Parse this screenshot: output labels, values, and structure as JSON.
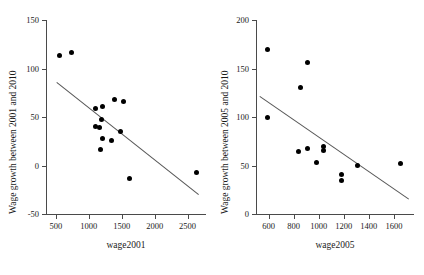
{
  "figure": {
    "panels": [
      {
        "id": "left",
        "xlabel": "wage2001",
        "ylabel": "Wage growth between 2001 and 2010",
        "xticks": [
          500,
          1000,
          1500,
          2000,
          2500
        ],
        "yticks": [
          -50,
          0,
          50,
          100,
          150
        ],
        "xlim": [
          350,
          2780
        ],
        "ylim": [
          -50,
          150
        ]
      },
      {
        "id": "right",
        "xlabel": "wage2005",
        "ylabel": "Wage growth between 2005 and 2010",
        "xticks": [
          600,
          800,
          1000,
          1200,
          1400,
          1600
        ],
        "yticks": [
          0,
          50,
          100,
          150,
          200
        ],
        "xlim": [
          500,
          1760
        ],
        "ylim": [
          0,
          200
        ]
      }
    ]
  },
  "chart_data": [
    {
      "type": "scatter",
      "title": "",
      "xlabel": "wage2001",
      "ylabel": "Wage growth between 2001 and 2010",
      "xlim": [
        350,
        2780
      ],
      "ylim": [
        -50,
        150
      ],
      "xticks": [
        500,
        1000,
        1500,
        2000,
        2500
      ],
      "yticks": [
        -50,
        0,
        50,
        100,
        150
      ],
      "grid": false,
      "legend": null,
      "points": [
        {
          "x": 550,
          "y": 113
        },
        {
          "x": 730,
          "y": 117
        },
        {
          "x": 1105,
          "y": 59
        },
        {
          "x": 1205,
          "y": 61
        },
        {
          "x": 1395,
          "y": 68
        },
        {
          "x": 1520,
          "y": 66
        },
        {
          "x": 1190,
          "y": 47
        },
        {
          "x": 1100,
          "y": 40
        },
        {
          "x": 1160,
          "y": 39
        },
        {
          "x": 1480,
          "y": 35
        },
        {
          "x": 1215,
          "y": 28
        },
        {
          "x": 1340,
          "y": 26
        },
        {
          "x": 1185,
          "y": 16
        },
        {
          "x": 1620,
          "y": -13
        },
        {
          "x": 2630,
          "y": -7
        }
      ],
      "trendline": {
        "x_start": 520,
        "y_start": 86,
        "x_end": 2680,
        "y_end": -30
      }
    },
    {
      "type": "scatter",
      "title": "",
      "xlabel": "wage2005",
      "ylabel": "Wage growth between 2005 and 2010",
      "xlim": [
        500,
        1760
      ],
      "ylim": [
        0,
        200
      ],
      "xticks": [
        600,
        800,
        1000,
        1200,
        1400,
        1600
      ],
      "yticks": [
        0,
        50,
        100,
        150,
        200
      ],
      "grid": false,
      "legend": null,
      "points": [
        {
          "x": 588,
          "y": 170
        },
        {
          "x": 588,
          "y": 99
        },
        {
          "x": 908,
          "y": 156
        },
        {
          "x": 858,
          "y": 130
        },
        {
          "x": 1040,
          "y": 70
        },
        {
          "x": 1040,
          "y": 65
        },
        {
          "x": 908,
          "y": 68
        },
        {
          "x": 840,
          "y": 64
        },
        {
          "x": 980,
          "y": 53
        },
        {
          "x": 1178,
          "y": 41
        },
        {
          "x": 1178,
          "y": 35
        },
        {
          "x": 1308,
          "y": 50
        },
        {
          "x": 1655,
          "y": 52
        }
      ],
      "trendline": {
        "x_start": 530,
        "y_start": 122,
        "x_end": 1720,
        "y_end": 16
      }
    }
  ]
}
